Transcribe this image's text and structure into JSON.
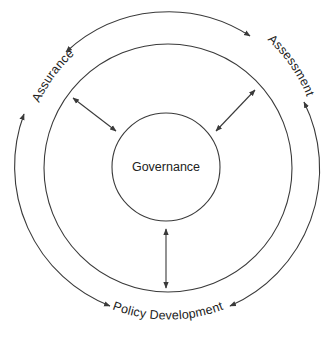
{
  "diagram": {
    "center": {
      "label": "Governance"
    },
    "outer_labels": {
      "left": "Assurance",
      "right": "Assessment",
      "bottom": "Policy Development"
    },
    "connectors": [
      {
        "from": "Governance",
        "to": "Assurance",
        "direction": "bidirectional"
      },
      {
        "from": "Governance",
        "to": "Assessment",
        "direction": "bidirectional"
      },
      {
        "from": "Governance",
        "to": "Policy Development",
        "direction": "bidirectional"
      }
    ],
    "cycle_arrows": [
      {
        "from": "Assessment",
        "to": "Assurance",
        "style": "arc"
      },
      {
        "from": "Assurance",
        "to": "Assessment",
        "style": "arc"
      },
      {
        "from": "Assurance",
        "to": "Policy Development",
        "style": "arc"
      },
      {
        "from": "Assessment",
        "to": "Policy Development",
        "style": "arc"
      }
    ],
    "colors": {
      "stroke": "#3a3a3a",
      "text": "#222222",
      "background": "#ffffff"
    }
  }
}
